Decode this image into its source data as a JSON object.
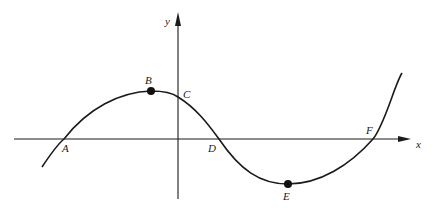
{
  "figure": {
    "axes": {
      "x_label": "x",
      "y_label": "y"
    },
    "points": [
      {
        "id": "A",
        "label": "A",
        "kind": "x-intercept"
      },
      {
        "id": "B",
        "label": "B",
        "kind": "local maximum",
        "marked": true
      },
      {
        "id": "C",
        "label": "C",
        "kind": "y-intercept"
      },
      {
        "id": "D",
        "label": "D",
        "kind": "x-intercept"
      },
      {
        "id": "E",
        "label": "E",
        "kind": "local minimum",
        "marked": true
      },
      {
        "id": "F",
        "label": "F",
        "kind": "x-intercept"
      }
    ],
    "colors": {
      "stroke": "#1a1a1a",
      "background": "#ffffff"
    }
  }
}
